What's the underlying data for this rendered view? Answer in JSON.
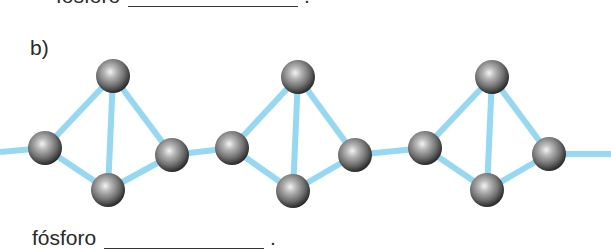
{
  "top_caption": {
    "label": "fósforo",
    "suffix": "."
  },
  "part_label": "b)",
  "bottom_caption": {
    "label": "fósforo",
    "suffix": "."
  },
  "colors": {
    "bond": "#96d8f2",
    "atom_dark": "#2b2b2b",
    "atom_mid": "#7a7a7a",
    "atom_light": "#f2f2f2",
    "text": "#2a2a2a"
  },
  "molecule": {
    "description": "Chain of P4 tetrahedra linked by bonds (red/violet phosphorus polymeric structure)",
    "units": [
      {
        "top": [
          113,
          76
        ],
        "left": [
          45,
          148
        ],
        "bottom": [
          108,
          190
        ],
        "right": [
          172,
          155
        ]
      },
      {
        "top": [
          298,
          77
        ],
        "left": [
          232,
          148
        ],
        "bottom": [
          293,
          191
        ],
        "right": [
          355,
          155
        ]
      },
      {
        "top": [
          492,
          77
        ],
        "left": [
          425,
          148
        ],
        "bottom": [
          487,
          190
        ],
        "right": [
          549,
          154
        ]
      }
    ],
    "atom_radius": 17
  }
}
